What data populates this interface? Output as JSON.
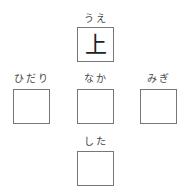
{
  "positions": {
    "top": {
      "reading": "うえ",
      "answer": "上"
    },
    "left": {
      "reading": "ひだり",
      "answer": ""
    },
    "center": {
      "reading": "なか",
      "answer": ""
    },
    "right": {
      "reading": "みぎ",
      "answer": ""
    },
    "bottom": {
      "reading": "した",
      "answer": ""
    }
  }
}
